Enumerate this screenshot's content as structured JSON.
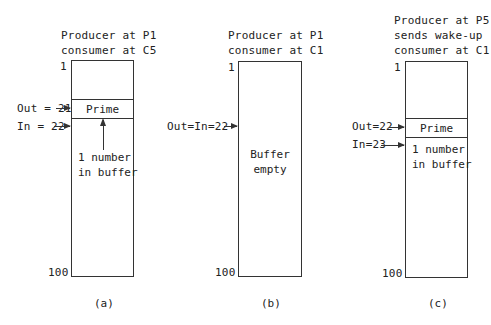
{
  "panels": [
    {
      "id": "a",
      "header": [
        "Producer at P1",
        "consumer at C5"
      ],
      "top_index": "1",
      "bottom_index": "100",
      "out_label": "Out = 21",
      "in_label": "In = 22",
      "slot_label": "Prime",
      "note": [
        "1 number",
        "in buffer"
      ],
      "caption": "(a)"
    },
    {
      "id": "b",
      "header": [
        "Producer at P1",
        "consumer at C1"
      ],
      "top_index": "1",
      "bottom_index": "100",
      "pointer_label": "Out=In=22",
      "note": [
        "Buffer",
        "empty"
      ],
      "caption": "(b)"
    },
    {
      "id": "c",
      "header": [
        "Producer at P5",
        "sends wake-up",
        "consumer at C1"
      ],
      "top_index": "1",
      "bottom_index": "100",
      "out_label": "Out=22",
      "in_label": "In=23",
      "slot_label": "Prime",
      "note": [
        "1 number",
        "in buffer"
      ],
      "caption": "(c)"
    }
  ]
}
